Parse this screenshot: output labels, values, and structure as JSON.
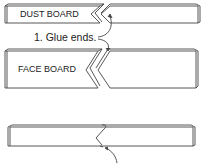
{
  "diagram": {
    "boards": [
      {
        "name": "dust-board",
        "label": "DUST BOARD"
      },
      {
        "name": "face-board",
        "label": "FACE BOARD"
      },
      {
        "name": "joined-board",
        "label": ""
      }
    ],
    "callouts": [
      {
        "step": 1,
        "text": "1. Glue ends."
      }
    ],
    "colors": {
      "line": "#444444",
      "background": "#ffffff",
      "text": "#222222"
    }
  }
}
